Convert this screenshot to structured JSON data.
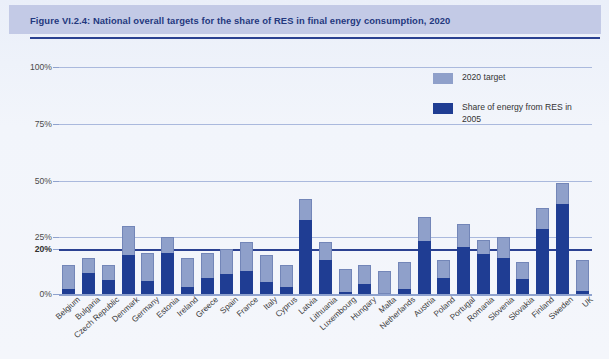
{
  "figure": {
    "title": "Figure VI.2.4: National overall targets for the share of RES in final energy consumption, 2020"
  },
  "legend": {
    "items": [
      {
        "label": "2020 target",
        "color": "#8fa0ca",
        "icon": "legend-swatch"
      },
      {
        "label": "Share of energy from RES in 2005",
        "color": "#1f3d93",
        "icon": "legend-swatch"
      }
    ]
  },
  "axis": {
    "y_ticks": [
      {
        "label": "100%",
        "value": 100,
        "bold": false
      },
      {
        "label": "75%",
        "value": 75,
        "bold": false
      },
      {
        "label": "50%",
        "value": 50,
        "bold": false
      },
      {
        "label": "25%",
        "value": 25,
        "bold": false
      },
      {
        "label": "20%",
        "value": 20,
        "bold": true
      },
      {
        "label": "0%",
        "value": 0,
        "bold": false
      }
    ]
  },
  "chart_data": {
    "type": "bar",
    "title": "Figure VI.2.4: National overall targets for the share of RES in final energy consumption, 2020",
    "xlabel": "",
    "ylabel": "",
    "ylim": [
      0,
      100
    ],
    "grid": true,
    "legend_position": "top-right",
    "overlay": true,
    "categories": [
      "Belgium",
      "Bulgaria",
      "Czech Republic",
      "Denmark",
      "Germany",
      "Estonia",
      "Ireland",
      "Greece",
      "Spain",
      "France",
      "Italy",
      "Cyprus",
      "Latvia",
      "Lithuania",
      "Luxembourg",
      "Hungary",
      "Malta",
      "Netherlands",
      "Austria",
      "Poland",
      "Portugal",
      "Romania",
      "Slovenia",
      "Slovakia",
      "Finland",
      "Sweden",
      "UK"
    ],
    "series": [
      {
        "name": "2020 target",
        "color": "#8fa0ca",
        "values": [
          13,
          16,
          13,
          30,
          18,
          25,
          16,
          18,
          20,
          23,
          17,
          13,
          42,
          23,
          11,
          13,
          10,
          14,
          34,
          15,
          31,
          24,
          25,
          14,
          38,
          49,
          15
        ]
      },
      {
        "name": "Share of energy from RES in 2005",
        "color": "#1f3d93",
        "values": [
          2.2,
          9.4,
          6.1,
          17,
          5.8,
          18,
          3.1,
          6.9,
          8.7,
          10.3,
          5.2,
          2.9,
          32.6,
          15,
          0.9,
          4.3,
          0,
          2.4,
          23.3,
          7.2,
          20.5,
          17.8,
          16,
          6.7,
          28.5,
          39.8,
          1.3
        ]
      }
    ],
    "highlight_line": {
      "value": 20,
      "label": "20%",
      "color": "#2b4191"
    }
  }
}
